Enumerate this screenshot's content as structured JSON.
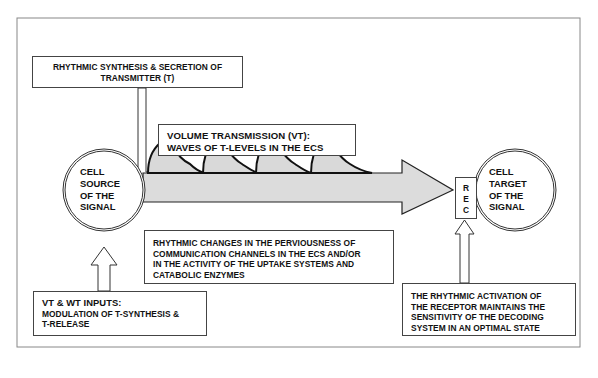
{
  "diagram": {
    "synthesis_box": {
      "lines": [
        "RHYTHMIC SYNTHESIS & SECRETION OF",
        "TRANSMITTER (T)"
      ]
    },
    "vt_box": {
      "lines": [
        "VOLUME TRANSMISSION (VT):",
        "WAVES OF T-LEVELS IN THE ECS"
      ]
    },
    "source_cell": {
      "lines": [
        "CELL",
        "SOURCE",
        "OF THE",
        "SIGNAL"
      ]
    },
    "target_cell": {
      "lines": [
        "CELL",
        "TARGET",
        "OF THE",
        "SIGNAL"
      ]
    },
    "receptor_box": {
      "letters": [
        "R",
        "E",
        "C"
      ]
    },
    "perviousness_box": {
      "lines": [
        "RHYTHMIC CHANGES IN THE PERVIOUSNESS OF",
        "COMMUNICATION CHANNELS IN THE ECS AND/OR",
        "IN THE ACTIVITY OF THE UPTAKE SYSTEMS AND",
        "CATABOLIC ENZYMES"
      ]
    },
    "inputs_box": {
      "heading": "VT & WT INPUTS:",
      "lines": [
        "MODULATION OF T-SYNTHESIS &",
        "T-RELEASE"
      ]
    },
    "receptor_note_box": {
      "lines": [
        "THE RHYTHMIC ACTIVATION OF",
        "THE RECEPTOR MAINTAINS THE",
        "SENSITIVITY OF THE DECODING",
        "SYSTEM IN AN OPTIMAL STATE"
      ]
    },
    "waves": {
      "count": 4
    },
    "colors": {
      "stroke": "#111111",
      "fill_shaded": "#d9d9d9",
      "frame": "#888888",
      "background": "#ffffff"
    }
  }
}
